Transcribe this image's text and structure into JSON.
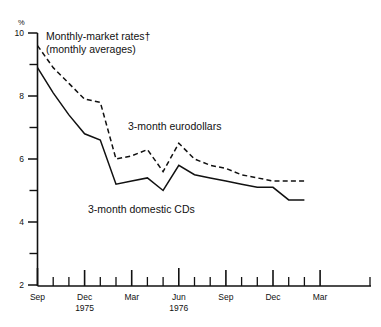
{
  "chart_data": {
    "type": "line",
    "title": "Monthly-market rates†",
    "subtitle": "(monthly averages)",
    "unit_label": "%",
    "xlabel": "",
    "ylabel": "",
    "ylim": [
      2,
      10
    ],
    "grid": false,
    "legend_position": "inline-annotations",
    "y_major_ticks": [
      10,
      8,
      6,
      4,
      2
    ],
    "y_minor_ticks": [
      9,
      7,
      5,
      3
    ],
    "y_tick_labels": [
      "10",
      "8",
      "6",
      "4",
      "2"
    ],
    "x_tick_labels": [
      {
        "label": "Sep",
        "year": "",
        "index": 0,
        "major": true
      },
      {
        "label": "Dec",
        "year": "1975",
        "index": 3,
        "major": true
      },
      {
        "label": "Mar",
        "year": "",
        "index": 6,
        "major": true
      },
      {
        "label": "Jun",
        "year": "1976",
        "index": 9,
        "major": true
      },
      {
        "label": "Sep",
        "year": "",
        "index": 12,
        "major": true
      },
      {
        "label": "Dec",
        "year": "",
        "index": 15,
        "major": true
      },
      {
        "label": "Mar",
        "year": "",
        "index": 18,
        "major": true
      }
    ],
    "x_months": [
      "Sep 1974",
      "Oct 1974",
      "Nov 1974",
      "Dec 1975",
      "Jan 1975",
      "Feb 1975",
      "Mar 1975",
      "Apr 1975",
      "May 1975",
      "Jun 1976",
      "Jul 1976",
      "Aug 1976",
      "Sep 1976",
      "Oct 1976",
      "Nov 1976",
      "Dec 1976",
      "Jan 1977",
      "Feb 1977",
      "Mar 1977",
      "Apr 1977",
      "May 1977"
    ],
    "series": [
      {
        "name": "3-month eurodollars",
        "style": "dashed",
        "annotation": "3-month eurodollars",
        "values": [
          9.6,
          8.9,
          8.4,
          7.9,
          7.8,
          6.0,
          6.1,
          6.3,
          5.6,
          6.5,
          6.0,
          5.8,
          5.7,
          5.5,
          5.4,
          5.3,
          5.3,
          5.3,
          null,
          null,
          null
        ]
      },
      {
        "name": "3-month domestic CDs",
        "style": "solid",
        "annotation": "3-month domestic CDs",
        "values": [
          8.9,
          8.1,
          7.4,
          6.8,
          6.6,
          5.2,
          5.3,
          5.4,
          5.0,
          5.8,
          5.5,
          5.4,
          5.3,
          5.2,
          5.1,
          5.1,
          4.7,
          4.7,
          null,
          null,
          null
        ]
      }
    ],
    "annotations": [
      {
        "text": "Monthly-market rates†",
        "role": "chart-title"
      },
      {
        "text": "(monthly averages)",
        "role": "chart-subtitle"
      },
      {
        "text": "3-month eurodollars",
        "role": "series-label"
      },
      {
        "text": "3-month domestic CDs",
        "role": "series-label"
      }
    ]
  }
}
